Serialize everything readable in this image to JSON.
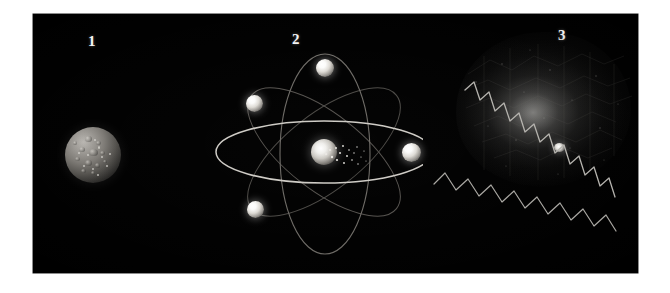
{
  "figure": {
    "background_color": "#ffffff",
    "plate_color": "#000000",
    "label_color": "#f4f4f4",
    "caption_alt": "Three-panel astronomical illustration on a black plate"
  },
  "panels": [
    {
      "number": "1",
      "name": "cratered-moon",
      "description": "Cratered rocky moon lit from the upper left against black space",
      "object_label": "moon",
      "light_direction": "upper-left"
    },
    {
      "number": "2",
      "name": "atom-model",
      "description": "Classical atom model: bright nucleus with four electrons on crossing elliptical orbits",
      "nucleus_label": "nucleus",
      "electron_label": "electron",
      "electron_count": "4",
      "orbit_count": "4"
    },
    {
      "number": "3",
      "name": "nebula-radiation",
      "description": "Diffuse glowing nebula cloud emitting zigzag radiation waves toward the lower right",
      "cloud_label": "nebula",
      "star_label": "star",
      "wave_label": "radiation wave",
      "wave_count": "2"
    }
  ],
  "colors": {
    "plate": "#000000",
    "paper": "#ffffff",
    "label": "#f4f4f4",
    "orbit_bright": "#c9c7c2",
    "orbit_dim": "#4a4845",
    "wave": "#a8a6a1",
    "glow": "#d7d6d2"
  }
}
